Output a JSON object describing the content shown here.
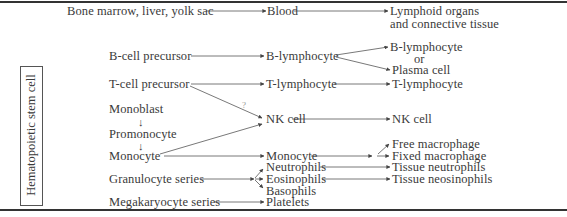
{
  "diagram": {
    "side_label": "Hematopoietic stem cell",
    "header_row": {
      "origin": "Bone marrow, liver, yolk sac",
      "transit": "Blood",
      "destination_line1": "Lymphoid organs",
      "destination_line2": "and connective tissue"
    },
    "rows": {
      "bcell_precursor": "B-cell precursor",
      "b_lymphocyte_blood": "B-lymphocyte",
      "b_lymphocyte_tissue": "B-lymphocyte",
      "or": "or",
      "plasma_cell": "Plasma cell",
      "tcell_precursor": "T-cell precursor",
      "t_lymphocyte_blood": "T-lymphocyte",
      "t_lymphocyte_tissue": "T-lymphocyte",
      "question_mark": "?",
      "monoblast": "Monoblast",
      "promonocyte": "Promonocyte",
      "monocyte_marrow": "Monocyte",
      "nk_cell_blood": "NK cell",
      "nk_cell_tissue": "NK cell",
      "monocyte_blood": "Monocyte",
      "free_macrophage": "Free macrophage",
      "fixed_macrophage": "Fixed macrophage",
      "granulocyte_series": "Granulocyte series",
      "neutrophils": "Neutrophils",
      "eosinophils": "Eosinophils",
      "basophils": "Basophils",
      "tissue_neutrophils": "Tissue neutrophils",
      "tissue_eosinophils": "Tissue neosinophils",
      "megakaryocyte_series": "Megakaryocyte series",
      "platelets": "Platelets",
      "down_arrow": "↓"
    }
  }
}
